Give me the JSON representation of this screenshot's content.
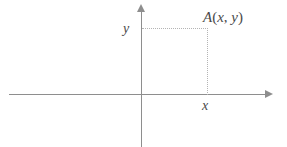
{
  "figure": {
    "background_color": "#ffffff",
    "axis_color": "#8e8e8e",
    "guide_color": "#b4b4b4",
    "label_color": "#4a4a4a"
  },
  "labels": {
    "point": {
      "name": "A",
      "open_paren": "(",
      "abscissa": "x",
      "comma": ",",
      "ordinate": "y",
      "close_paren": ")",
      "full": "A(x, y)"
    },
    "y_axis_value": "y",
    "x_axis_value": "x"
  },
  "chart_data": {
    "type": "scatter",
    "title": "",
    "xlabel": "",
    "ylabel": "",
    "grid": false,
    "legend": null,
    "axes": {
      "x_axis": {
        "label": "",
        "origin_px": 141,
        "arrow": "right",
        "ticks": []
      },
      "y_axis": {
        "label": "",
        "origin_px": 95,
        "arrow": "up",
        "ticks": []
      }
    },
    "points": [
      {
        "label": "A(x, y)",
        "x": "x",
        "y": "y",
        "guides": [
          "horizontal-dotted-to-y-axis",
          "vertical-dotted-to-x-axis"
        ]
      }
    ],
    "annotations": [
      {
        "text": "A(x, y)",
        "position": "above-right-of-point"
      },
      {
        "text": "y",
        "position": "left-of-y-axis"
      },
      {
        "text": "x",
        "position": "below-x-axis"
      }
    ]
  }
}
